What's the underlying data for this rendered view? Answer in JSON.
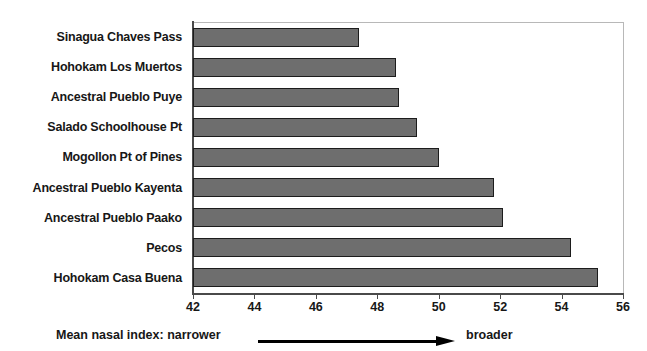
{
  "chart_data": {
    "type": "bar",
    "orientation": "horizontal",
    "title": "",
    "xlabel": "Mean nasal index: narrower → broader",
    "ylabel": "",
    "xlim": [
      42,
      56
    ],
    "xticks": [
      42,
      44,
      46,
      48,
      50,
      52,
      54,
      56
    ],
    "xtick_labels": [
      "42",
      "44",
      "46",
      "48",
      "50",
      "52",
      "54",
      "56"
    ],
    "grid": false,
    "legend": null,
    "categories": [
      "Sinagua Chaves Pass",
      "Hohokam Los Muertos",
      "Ancestral Pueblo Puye",
      "Salado Schoolhouse Pt",
      "Mogollon Pt of Pines",
      "Ancestral Pueblo Kayenta",
      "Ancestral Pueblo Paako",
      "Pecos",
      "Hohokam Casa Buena"
    ],
    "values": [
      47.4,
      48.6,
      48.7,
      49.3,
      50.0,
      51.8,
      52.1,
      54.3,
      55.2
    ],
    "bar_color": "#6e6e6e",
    "bar_border_color": "#1c1c1c"
  },
  "caption": {
    "left_text": "Mean nasal index: narrower",
    "right_text": "broader",
    "arrow": "right-arrow-icon"
  },
  "axis": {
    "min_label": "42",
    "max_label": "56"
  }
}
